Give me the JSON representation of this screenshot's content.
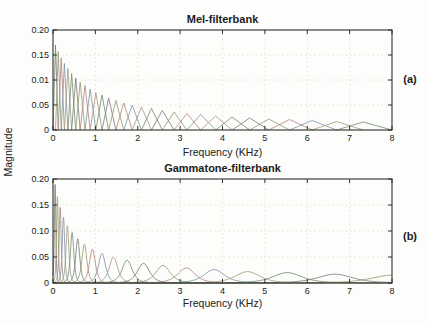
{
  "figure": {
    "background": "#fdfdfb",
    "axis_color": "#2f2f2f",
    "text_color": "#1c1c1c",
    "grid_color": "#d9d9d4",
    "line_colors": [
      "#7a7a7a",
      "#8fa06a",
      "#b38484",
      "#7d94a8",
      "#a8987d",
      "#6f8f6f"
    ]
  },
  "shared": {
    "ylabel": "Magnitude"
  },
  "chart_data": [
    {
      "type": "line",
      "title": "Mel-filterbank",
      "panel_label": "(a)",
      "xlabel": "Frequency (KHz)",
      "ylabel": "Magnitude",
      "xlim": [
        0,
        8
      ],
      "ylim": [
        0,
        0.2
      ],
      "x_tick_values": [
        0,
        1,
        2,
        3,
        4,
        5,
        6,
        7,
        8
      ],
      "x_tick_labels": [
        "0",
        "1",
        "2",
        "3",
        "4",
        "5",
        "6",
        "7",
        "8"
      ],
      "y_tick_values": [
        0.2,
        0.15,
        0.1,
        0.05,
        0
      ],
      "y_tick_labels": [
        "0.20",
        "0.15",
        "0.01",
        "0.05",
        "0"
      ],
      "grid": true,
      "legend": null,
      "filter_shape": "triangle",
      "filters": [
        {
          "lo": 0.0,
          "center": 0.0593,
          "hi": 0.1236,
          "peak": 0.17
        },
        {
          "lo": 0.0593,
          "center": 0.1236,
          "hi": 0.1933,
          "peak": 0.157
        },
        {
          "lo": 0.1236,
          "center": 0.1933,
          "hi": 0.269,
          "peak": 0.144
        },
        {
          "lo": 0.1933,
          "center": 0.269,
          "hi": 0.3511,
          "peak": 0.133
        },
        {
          "lo": 0.269,
          "center": 0.3511,
          "hi": 0.44,
          "peak": 0.123
        },
        {
          "lo": 0.3511,
          "center": 0.44,
          "hi": 0.5366,
          "peak": 0.113
        },
        {
          "lo": 0.44,
          "center": 0.5366,
          "hi": 0.6413,
          "peak": 0.104
        },
        {
          "lo": 0.5366,
          "center": 0.6413,
          "hi": 0.7549,
          "peak": 0.096
        },
        {
          "lo": 0.6413,
          "center": 0.7549,
          "hi": 0.8781,
          "peak": 0.089
        },
        {
          "lo": 0.7549,
          "center": 0.8781,
          "hi": 1.0117,
          "peak": 0.082
        },
        {
          "lo": 0.8781,
          "center": 1.0117,
          "hi": 1.1566,
          "peak": 0.075
        },
        {
          "lo": 1.0117,
          "center": 1.1566,
          "hi": 1.3138,
          "peak": 0.07
        },
        {
          "lo": 1.1566,
          "center": 1.3138,
          "hi": 1.4843,
          "peak": 0.064
        },
        {
          "lo": 1.3138,
          "center": 1.4843,
          "hi": 1.6693,
          "peak": 0.059
        },
        {
          "lo": 1.4843,
          "center": 1.6693,
          "hi": 1.8699,
          "peak": 0.054
        },
        {
          "lo": 1.6693,
          "center": 1.8699,
          "hi": 2.0875,
          "peak": 0.05
        },
        {
          "lo": 1.8699,
          "center": 2.0875,
          "hi": 2.3236,
          "peak": 0.046
        },
        {
          "lo": 2.0875,
          "center": 2.3236,
          "hi": 2.5796,
          "peak": 0.043
        },
        {
          "lo": 2.3236,
          "center": 2.5796,
          "hi": 2.8573,
          "peak": 0.039
        },
        {
          "lo": 2.5796,
          "center": 2.8573,
          "hi": 3.1585,
          "peak": 0.036
        },
        {
          "lo": 2.8573,
          "center": 3.1585,
          "hi": 3.4852,
          "peak": 0.033
        },
        {
          "lo": 3.1585,
          "center": 3.4852,
          "hi": 3.8395,
          "peak": 0.031
        },
        {
          "lo": 3.4852,
          "center": 3.8395,
          "hi": 4.2239,
          "peak": 0.028
        },
        {
          "lo": 3.8395,
          "center": 4.2239,
          "hi": 4.6408,
          "peak": 0.026
        },
        {
          "lo": 4.2239,
          "center": 4.6408,
          "hi": 5.093,
          "peak": 0.024
        },
        {
          "lo": 4.6408,
          "center": 5.093,
          "hi": 5.5835,
          "peak": 0.022
        },
        {
          "lo": 5.093,
          "center": 5.5835,
          "hi": 6.1156,
          "peak": 0.021
        },
        {
          "lo": 5.5835,
          "center": 6.1156,
          "hi": 6.6926,
          "peak": 0.019
        },
        {
          "lo": 6.1156,
          "center": 6.6926,
          "hi": 7.3185,
          "peak": 0.017
        },
        {
          "lo": 6.6926,
          "center": 7.3185,
          "hi": 8.0,
          "peak": 0.016
        }
      ]
    },
    {
      "type": "line",
      "title": "Gammatone-filterbank",
      "panel_label": "(b)",
      "xlabel": "Frequency (KHz)",
      "ylabel": "Magnitude",
      "xlim": [
        0,
        8
      ],
      "ylim": [
        0,
        0.2
      ],
      "x_tick_values": [
        0,
        1,
        2,
        3,
        4,
        5,
        6,
        7,
        8
      ],
      "x_tick_labels": [
        "0",
        "1",
        "2",
        "3",
        "4",
        "5",
        "6",
        "7",
        "8"
      ],
      "y_tick_values": [
        0.2,
        0.15,
        0.1,
        0.05,
        0
      ],
      "y_tick_labels": [
        "0.20",
        "0.15",
        "0.10",
        "0.05",
        "0"
      ],
      "grid": true,
      "legend": null,
      "filter_shape": "gammatone",
      "filters": [
        {
          "center": 0.05,
          "erb": 0.0301,
          "peak": 0.19
        },
        {
          "center": 0.104,
          "erb": 0.036,
          "peak": 0.166
        },
        {
          "center": 0.169,
          "erb": 0.043,
          "peak": 0.146
        },
        {
          "center": 0.247,
          "erb": 0.0514,
          "peak": 0.127
        },
        {
          "center": 0.34,
          "erb": 0.0614,
          "peak": 0.111
        },
        {
          "center": 0.451,
          "erb": 0.0733,
          "peak": 0.097
        },
        {
          "center": 0.583,
          "erb": 0.0876,
          "peak": 0.085
        },
        {
          "center": 0.741,
          "erb": 0.1047,
          "peak": 0.075
        },
        {
          "center": 0.93,
          "erb": 0.1251,
          "peak": 0.065
        },
        {
          "center": 1.156,
          "erb": 0.1495,
          "peak": 0.057
        },
        {
          "center": 1.426,
          "erb": 0.1786,
          "peak": 0.05
        },
        {
          "center": 1.749,
          "erb": 0.2135,
          "peak": 0.044
        },
        {
          "center": 2.135,
          "erb": 0.2552,
          "peak": 0.038
        },
        {
          "center": 2.596,
          "erb": 0.3049,
          "peak": 0.034
        },
        {
          "center": 3.147,
          "erb": 0.3643,
          "peak": 0.029
        },
        {
          "center": 3.804,
          "erb": 0.4353,
          "peak": 0.026
        },
        {
          "center": 4.591,
          "erb": 0.5203,
          "peak": 0.022
        },
        {
          "center": 5.532,
          "erb": 0.6218,
          "peak": 0.02
        },
        {
          "center": 6.654,
          "erb": 0.743,
          "peak": 0.017
        },
        {
          "center": 7.995,
          "erb": 0.8877,
          "peak": 0.015
        }
      ]
    }
  ]
}
